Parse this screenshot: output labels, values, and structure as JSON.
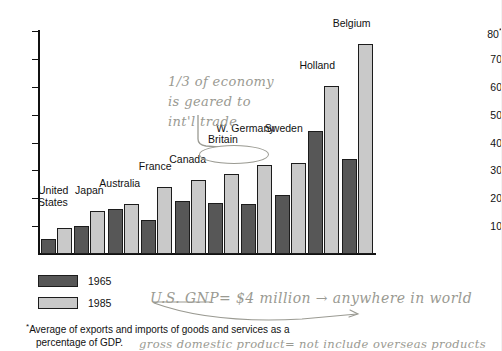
{
  "chart_data": {
    "type": "bar",
    "title": "",
    "xlabel": "",
    "ylabel": "",
    "ylim": [
      0,
      80
    ],
    "yticks": [
      10,
      20,
      30,
      40,
      50,
      60,
      70,
      80
    ],
    "ytick_labels": [
      "10",
      "20",
      "30",
      "40",
      "50",
      "60",
      "70",
      "80"
    ],
    "y_top_label_suffix": "*",
    "grid": false,
    "legend_position": "bottom-left",
    "categories": [
      "United States",
      "Japan",
      "Australia",
      "France",
      "Canada",
      "Britain",
      "W. Germany",
      "Sweden",
      "Holland",
      "Belgium"
    ],
    "series": [
      {
        "name": "1965",
        "color": "#575757",
        "values": [
          5.4,
          10.0,
          16.2,
          12.2,
          19.0,
          18.4,
          18.0,
          21.2,
          44.0,
          34.2
        ]
      },
      {
        "name": "1985",
        "color": "#c9c9c9",
        "values": [
          9.2,
          15.4,
          18.0,
          24.0,
          26.5,
          28.6,
          32.0,
          32.6,
          60.2,
          75.2
        ]
      }
    ],
    "footnote": "*Average of exports and imports of goods and services as a percentage of GDP."
  },
  "axis": {
    "tick_labels": [
      "80",
      "70",
      "60",
      "50",
      "40",
      "30",
      "20",
      "10"
    ],
    "top_tick_star": "*"
  },
  "country_labels": [
    {
      "name": "United States",
      "line1": "United",
      "line2": "States"
    },
    {
      "name": "Japan",
      "line1": "Japan",
      "line2": ""
    },
    {
      "name": "Australia",
      "line1": "Australia",
      "line2": ""
    },
    {
      "name": "France",
      "line1": "France",
      "line2": ""
    },
    {
      "name": "Canada",
      "line1": "Canada",
      "line2": ""
    },
    {
      "name": "Britain",
      "line1": "Britain",
      "line2": ""
    },
    {
      "name": "W. Germany",
      "line1": "W. Germany",
      "line2": ""
    },
    {
      "name": "Sweden",
      "line1": "Sweden",
      "line2": ""
    },
    {
      "name": "Holland",
      "line1": "Holland",
      "line2": ""
    },
    {
      "name": "Belgium",
      "line1": "Belgium",
      "line2": ""
    }
  ],
  "legend": {
    "items": [
      {
        "label": "1965",
        "color": "#575757"
      },
      {
        "label": "1985",
        "color": "#c9c9c9"
      }
    ]
  },
  "footnote": {
    "star": "*",
    "line1": "Average of exports and imports of goods and services as a",
    "line2": "percentage of GDP."
  },
  "annotations": {
    "economy_note": {
      "line1": "1/3 of economy",
      "line2": "is geared to",
      "line3": "int'l trade"
    },
    "gnp_note": "U.S. GNP= $4 million → anywhere in world",
    "gdp_note_line1": "gross domestic product= not include overseas products",
    "gdp_note_line2": "",
    "circled_item": "Britain"
  },
  "colors": {
    "series_1965": "#575757",
    "series_1985": "#c9c9c9",
    "axis": "#111111",
    "handwriting": "#9a9a92",
    "background": "#ffffff"
  }
}
